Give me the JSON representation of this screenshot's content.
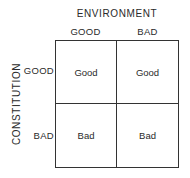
{
  "diagram": {
    "column_axis": {
      "title": "ENVIRONMENT",
      "headers": [
        "GOOD",
        "BAD"
      ]
    },
    "row_axis": {
      "title": "CONSTITUTION",
      "headers": [
        "GOOD",
        "BAD"
      ]
    },
    "cells": [
      [
        "Good",
        "Good"
      ],
      [
        "Bad",
        "Bad"
      ]
    ],
    "colors": {
      "line": "#333333",
      "text": "#2a2a2a",
      "background": "#ffffff"
    }
  }
}
